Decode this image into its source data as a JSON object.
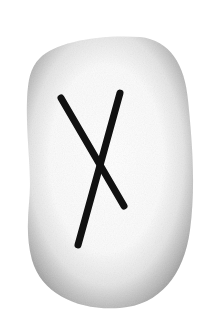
{
  "image": {
    "subject": "rune-stone",
    "rune_glyph": "ᚾ",
    "rune_name": "Naudhiz",
    "colors": {
      "background": "#ffffff",
      "stone_edge": "#8a8a8a",
      "stone_center": "#ffffff",
      "rune_ink": "#111111"
    }
  }
}
